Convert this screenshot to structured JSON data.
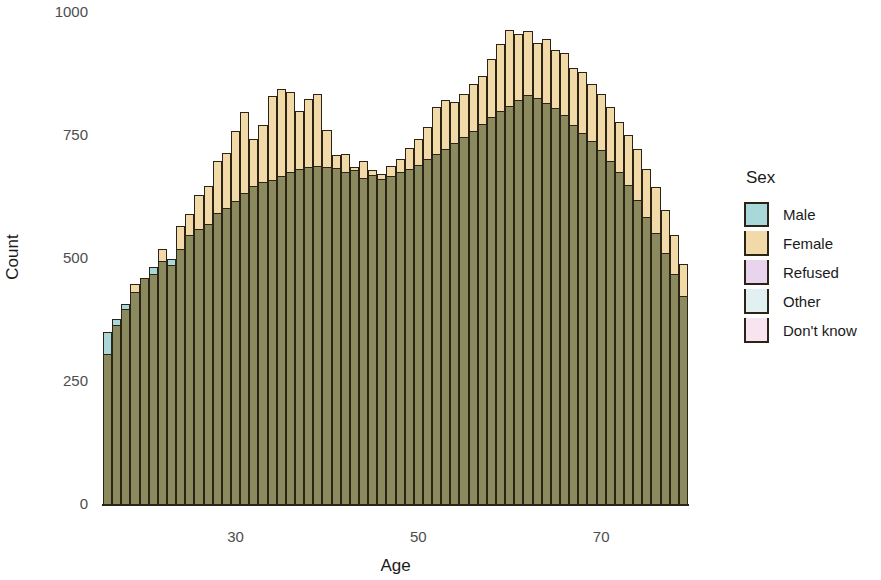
{
  "chart_data": {
    "type": "bar",
    "title": "",
    "subtitle": "",
    "xlabel": "Age",
    "ylabel": "Count",
    "xlim": [
      16,
      85
    ],
    "ylim": [
      0,
      1000
    ],
    "xticks": [
      30,
      50,
      70
    ],
    "yticks": [
      0,
      250,
      500,
      750,
      1000
    ],
    "grid": false,
    "legend_position": "right",
    "legend_title": "Sex",
    "bar_mode": "overlap",
    "bin_width": 1,
    "x_start": 16,
    "legend": [
      {
        "label": "Male",
        "color": "#a9d8da"
      },
      {
        "label": "Female",
        "color": "#f2d9a8"
      },
      {
        "label": "Refused",
        "color": "#e8d4ec"
      },
      {
        "label": "Other",
        "color": "#e2f0f2"
      },
      {
        "label": "Don't know",
        "color": "#f8e4ee"
      }
    ],
    "categories": [
      16,
      17,
      18,
      19,
      20,
      21,
      22,
      23,
      24,
      25,
      26,
      27,
      28,
      29,
      30,
      31,
      32,
      33,
      34,
      35,
      36,
      37,
      38,
      39,
      40,
      41,
      42,
      43,
      44,
      45,
      46,
      47,
      48,
      49,
      50,
      51,
      52,
      53,
      54,
      55,
      56,
      57,
      58,
      59,
      60,
      61,
      62,
      63,
      64,
      65,
      66,
      67,
      68,
      69,
      70,
      71,
      72,
      73,
      74,
      75,
      76,
      77,
      78,
      79
    ],
    "series": [
      {
        "name": "Male",
        "color": "#a9d8da",
        "values": [
          352,
          378,
          408,
          432,
          462,
          484,
          496,
          500,
          520,
          548,
          560,
          572,
          594,
          604,
          618,
          634,
          648,
          656,
          660,
          668,
          676,
          682,
          688,
          690,
          688,
          684,
          676,
          680,
          664,
          670,
          662,
          668,
          676,
          682,
          692,
          704,
          714,
          724,
          736,
          748,
          760,
          774,
          788,
          800,
          812,
          824,
          834,
          828,
          818,
          806,
          792,
          772,
          756,
          740,
          722,
          700,
          676,
          650,
          620,
          586,
          552,
          512,
          470,
          424
        ]
      },
      {
        "name": "Female",
        "color": "#f2d9a8",
        "values": [
          306,
          366,
          398,
          450,
          462,
          470,
          520,
          488,
          568,
          592,
          630,
          648,
          700,
          716,
          760,
          798,
          744,
          772,
          832,
          846,
          840,
          800,
          826,
          836,
          762,
          712,
          714,
          688,
          700,
          680,
          672,
          690,
          704,
          726,
          744,
          768,
          808,
          824,
          820,
          836,
          856,
          872,
          906,
          938,
          966,
          958,
          964,
          940,
          948,
          924,
          918,
          888,
          880,
          856,
          836,
          810,
          778,
          752,
          724,
          684,
          646,
          600,
          548,
          490
        ]
      },
      {
        "name": "Refused",
        "color": "#e8d4ec",
        "values": [
          0,
          0,
          0,
          0,
          0,
          0,
          0,
          0,
          0,
          0,
          0,
          0,
          0,
          0,
          0,
          0,
          0,
          0,
          0,
          0,
          0,
          0,
          0,
          0,
          0,
          0,
          0,
          0,
          0,
          0,
          0,
          0,
          0,
          0,
          0,
          0,
          0,
          0,
          0,
          0,
          0,
          0,
          0,
          0,
          0,
          0,
          0,
          0,
          0,
          0,
          0,
          0,
          0,
          0,
          0,
          0,
          0,
          0,
          0,
          0,
          0,
          0,
          0,
          0
        ]
      },
      {
        "name": "Other",
        "color": "#e2f0f2",
        "values": [
          0,
          0,
          0,
          0,
          0,
          0,
          0,
          0,
          0,
          0,
          0,
          0,
          0,
          0,
          0,
          0,
          0,
          0,
          0,
          0,
          0,
          0,
          0,
          0,
          0,
          0,
          0,
          0,
          0,
          0,
          0,
          0,
          0,
          0,
          0,
          0,
          0,
          0,
          0,
          0,
          0,
          0,
          0,
          0,
          0,
          0,
          0,
          0,
          0,
          0,
          0,
          0,
          0,
          0,
          0,
          0,
          0,
          0,
          0,
          0,
          0,
          0,
          0,
          0
        ]
      },
      {
        "name": "Don't know",
        "color": "#f8e4ee",
        "values": [
          0,
          0,
          0,
          0,
          0,
          0,
          0,
          0,
          0,
          0,
          0,
          0,
          0,
          0,
          0,
          0,
          0,
          0,
          0,
          0,
          0,
          0,
          0,
          0,
          0,
          0,
          0,
          0,
          0,
          0,
          0,
          0,
          0,
          0,
          0,
          0,
          0,
          0,
          0,
          0,
          0,
          0,
          0,
          0,
          0,
          0,
          0,
          0,
          0,
          0,
          0,
          0,
          0,
          0,
          0,
          0,
          0,
          0,
          0,
          0,
          0,
          0,
          0,
          0
        ]
      }
    ]
  },
  "axes": {
    "y_title": "Count",
    "x_title": "Age",
    "y_tick_labels": [
      "0",
      "250",
      "500",
      "750",
      "1000"
    ],
    "x_tick_labels": [
      "30",
      "50",
      "70"
    ]
  },
  "legend_panel": {
    "title": "Sex",
    "items": [
      {
        "label": "Male"
      },
      {
        "label": "Female"
      },
      {
        "label": "Refused"
      },
      {
        "label": "Other"
      },
      {
        "label": "Don't know"
      }
    ]
  },
  "colors": {
    "male": "#a9d8da",
    "female": "#f2d9a8",
    "refused": "#e8d4ec",
    "other": "#e2f0f2",
    "dont_know": "#f8e4ee",
    "overlap_blend": "#8a8a5e",
    "outline": "#2b2416",
    "text": "#1a1a1a",
    "tick_text": "#4d4d4d",
    "background": "#ffffff"
  }
}
